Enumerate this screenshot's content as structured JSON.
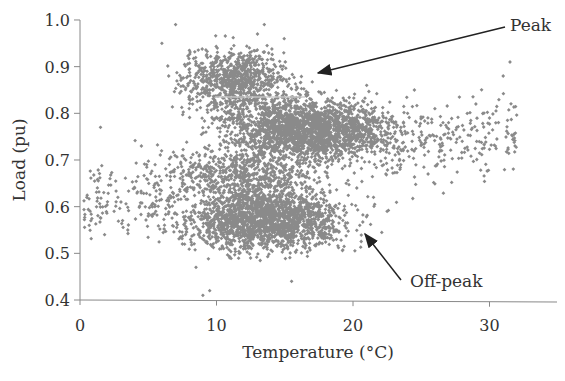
{
  "chart_data": {
    "type": "scatter",
    "title": "",
    "xlabel": "Temperature (°C)",
    "ylabel": "Load (pu)",
    "xlim": [
      0,
      35
    ],
    "ylim": [
      0.4,
      1.0
    ],
    "x_ticks": [
      0,
      10,
      20,
      30
    ],
    "x_tick_labels": [
      "0",
      "10",
      "20",
      "30"
    ],
    "y_ticks": [
      0.4,
      0.5,
      0.6,
      0.7,
      0.8,
      0.9,
      1.0
    ],
    "y_tick_labels": [
      "0.4",
      "0.5",
      "0.6",
      "0.7",
      "0.8",
      "0.9",
      "1.0"
    ],
    "grid": false,
    "legend": null,
    "marker": {
      "shape": "diamond",
      "color": "#8a8a8a",
      "size": 3
    },
    "annotations": [
      {
        "text": "Peak",
        "text_xy": [
          28.5,
          0.96
        ],
        "arrow_to": [
          15.5,
          0.88
        ]
      },
      {
        "text": "Off-peak",
        "text_xy": [
          24.0,
          0.47
        ],
        "arrow_to": [
          20.6,
          0.56
        ]
      }
    ],
    "clusters": [
      {
        "name": "Peak",
        "description": "Dense upper cluster of high-load points",
        "x_range": [
          5,
          32
        ],
        "y_range": [
          0.65,
          1.0
        ],
        "center": [
          16,
          0.77
        ]
      },
      {
        "name": "Off-peak",
        "description": "Dense lower cluster of low-load points",
        "x_range": [
          0,
          25
        ],
        "y_range": [
          0.41,
          0.68
        ],
        "center": [
          13,
          0.57
        ]
      }
    ],
    "sample_points": [
      [
        0.5,
        0.62
      ],
      [
        0.8,
        0.57
      ],
      [
        1.5,
        0.77
      ],
      [
        1.8,
        0.54
      ],
      [
        2.2,
        0.66
      ],
      [
        2.5,
        0.59
      ],
      [
        3.0,
        0.61
      ],
      [
        3.5,
        0.55
      ],
      [
        4.0,
        0.64
      ],
      [
        4.5,
        0.73
      ],
      [
        5.0,
        0.58
      ],
      [
        5.5,
        0.69
      ],
      [
        6.0,
        0.95
      ],
      [
        6.5,
        0.88
      ],
      [
        7.0,
        0.99
      ],
      [
        7.5,
        0.52
      ],
      [
        8.0,
        0.83
      ],
      [
        8.5,
        0.47
      ],
      [
        9.0,
        0.41
      ],
      [
        9.5,
        0.42
      ],
      [
        10.0,
        0.91
      ],
      [
        10.5,
        0.62
      ],
      [
        11.0,
        0.86
      ],
      [
        11.5,
        0.55
      ],
      [
        12.0,
        0.78
      ],
      [
        12.5,
        0.49
      ],
      [
        13.0,
        0.97
      ],
      [
        13.5,
        0.99
      ],
      [
        14.0,
        0.58
      ],
      [
        14.5,
        0.81
      ],
      [
        15.0,
        0.73
      ],
      [
        15.5,
        0.44
      ],
      [
        16.0,
        0.76
      ],
      [
        16.5,
        0.61
      ],
      [
        17.0,
        0.74
      ],
      [
        17.5,
        0.52
      ],
      [
        18.0,
        0.79
      ],
      [
        18.5,
        0.57
      ],
      [
        19.0,
        0.72
      ],
      [
        19.5,
        0.65
      ],
      [
        20.0,
        0.75
      ],
      [
        20.5,
        0.56
      ],
      [
        21.0,
        0.86
      ],
      [
        21.5,
        0.62
      ],
      [
        22.0,
        0.78
      ],
      [
        22.5,
        0.59
      ],
      [
        23.0,
        0.73
      ],
      [
        23.5,
        0.69
      ],
      [
        24.0,
        0.8
      ],
      [
        24.5,
        0.85
      ],
      [
        25.0,
        0.76
      ],
      [
        25.5,
        0.67
      ],
      [
        26.0,
        0.81
      ],
      [
        26.5,
        0.72
      ],
      [
        27.0,
        0.78
      ],
      [
        28.0,
        0.74
      ],
      [
        29.0,
        0.82
      ],
      [
        30.0,
        0.79
      ],
      [
        31.0,
        0.88
      ],
      [
        31.5,
        0.91
      ]
    ],
    "approx_point_count": 5000
  }
}
